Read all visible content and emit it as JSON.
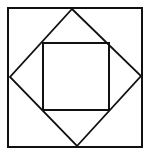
{
  "diagram": {
    "stroke_color": "#111111",
    "background": "#ffffff",
    "outer_square": {
      "x1": 8,
      "y1": 8,
      "x2": 142,
      "y2": 147
    },
    "diamond": {
      "top": [
        72,
        9
      ],
      "right": [
        141,
        76
      ],
      "bottom": [
        77,
        146
      ],
      "left": [
        10,
        77
      ]
    },
    "inner_square": {
      "x1": 43,
      "y1": 43,
      "x2": 109,
      "y2": 110
    }
  }
}
